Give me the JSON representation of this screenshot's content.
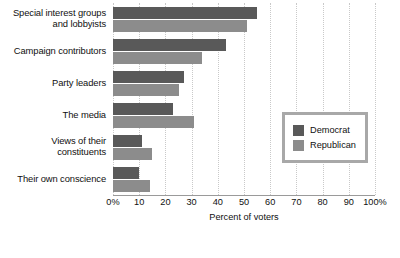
{
  "chart_data": {
    "type": "bar",
    "orientation": "horizontal",
    "title": "",
    "xlabel": "Percent of voters",
    "ylabel": "",
    "xlim": [
      0,
      100
    ],
    "xticks": [
      0,
      10,
      20,
      30,
      40,
      50,
      60,
      70,
      80,
      90,
      100
    ],
    "xtick_labels": [
      "0%",
      "10",
      "20",
      "30",
      "40",
      "50",
      "60",
      "70",
      "80",
      "90",
      "100%"
    ],
    "grid": true,
    "grid_axis": "x",
    "legend_position": "center right",
    "categories": [
      "Special interest groups and lobbyists",
      "Campaign contributors",
      "Party leaders",
      "The media",
      "Views of their constituents",
      "Their own conscience"
    ],
    "category_lines": [
      [
        "Special interest groups",
        "and lobbyists"
      ],
      [
        "Campaign contributors"
      ],
      [
        "Party leaders"
      ],
      [
        "The media"
      ],
      [
        "Views of their",
        "constituents"
      ],
      [
        "Their own conscience"
      ]
    ],
    "series": [
      {
        "name": "Democrat",
        "color": "#595959",
        "values": [
          55,
          43,
          27,
          23,
          11,
          10
        ]
      },
      {
        "name": "Republican",
        "color": "#8c8c8c",
        "values": [
          51,
          34,
          25,
          31,
          15,
          14
        ]
      }
    ]
  },
  "legend": {
    "items": [
      {
        "label": "Democrat",
        "color": "#595959"
      },
      {
        "label": "Republican",
        "color": "#8c8c8c"
      }
    ]
  },
  "axis": {
    "x_title": "Percent of voters"
  }
}
